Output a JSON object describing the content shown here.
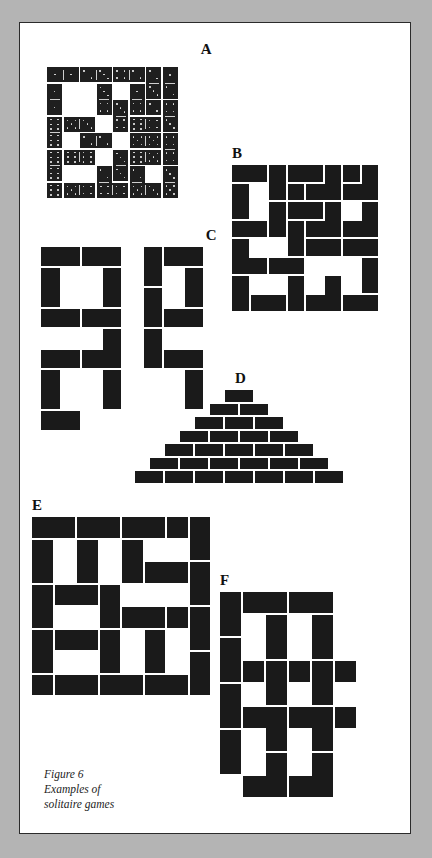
{
  "page": {
    "background_color": "#b4b4b4",
    "paper_color": "#ffffff",
    "border_color": "#2b2b2b",
    "domino_color": "#1a1a1a",
    "pip_color": "#e8e8e8"
  },
  "caption": {
    "line1": "Figure 6",
    "line2": "Examples of",
    "line3": "solitaire games"
  },
  "figures": [
    {
      "id": "A",
      "label": "A",
      "description": "8 by 8 square frame solitaire layout made of pipped dominoes",
      "cols": 8,
      "rows": 8,
      "cell": 16.5,
      "dominoes": [
        {
          "x": 0,
          "y": 0,
          "w": 2,
          "h": 1,
          "pips": [
            1,
            1
          ]
        },
        {
          "x": 2,
          "y": 0,
          "w": 2,
          "h": 1,
          "pips": [
            2,
            3
          ]
        },
        {
          "x": 4,
          "y": 0,
          "w": 2,
          "h": 1,
          "pips": [
            4,
            2
          ]
        },
        {
          "x": 6,
          "y": 0,
          "w": 1,
          "h": 2,
          "pips": [
            2,
            3
          ]
        },
        {
          "x": 7,
          "y": 0,
          "w": 1,
          "h": 2,
          "pips": [
            1,
            2
          ]
        },
        {
          "x": 0,
          "y": 1,
          "w": 1,
          "h": 2,
          "pips": [
            1,
            1
          ]
        },
        {
          "x": 3,
          "y": 1,
          "w": 1,
          "h": 2,
          "pips": [
            3,
            4
          ]
        },
        {
          "x": 5,
          "y": 1,
          "w": 1,
          "h": 2,
          "pips": [
            1,
            4
          ]
        },
        {
          "x": 4,
          "y": 2,
          "w": 1,
          "h": 2,
          "pips": [
            3,
            4
          ]
        },
        {
          "x": 7,
          "y": 2,
          "w": 1,
          "h": 2,
          "pips": [
            4,
            3
          ]
        },
        {
          "x": 0,
          "y": 3,
          "w": 1,
          "h": 2,
          "pips": [
            6,
            6
          ]
        },
        {
          "x": 1,
          "y": 3,
          "w": 2,
          "h": 1,
          "pips": [
            5,
            3
          ]
        },
        {
          "x": 5,
          "y": 3,
          "w": 2,
          "h": 1,
          "pips": [
            6,
            4
          ]
        },
        {
          "x": 2,
          "y": 4,
          "w": 2,
          "h": 1,
          "pips": [
            2,
            2
          ]
        },
        {
          "x": 5,
          "y": 4,
          "w": 2,
          "h": 1,
          "pips": [
            5,
            5
          ]
        },
        {
          "x": 7,
          "y": 4,
          "w": 1,
          "h": 2,
          "pips": [
            4,
            4
          ]
        },
        {
          "x": 1,
          "y": 5,
          "w": 2,
          "h": 1,
          "pips": [
            6,
            6
          ]
        },
        {
          "x": 4,
          "y": 5,
          "w": 1,
          "h": 2,
          "pips": [
            3,
            3
          ]
        },
        {
          "x": 5,
          "y": 5,
          "w": 2,
          "h": 1,
          "pips": [
            6,
            5
          ]
        },
        {
          "x": 0,
          "y": 5,
          "w": 1,
          "h": 2,
          "pips": [
            6,
            6
          ]
        },
        {
          "x": 3,
          "y": 6,
          "w": 1,
          "h": 2,
          "pips": [
            2,
            3
          ]
        },
        {
          "x": 5,
          "y": 6,
          "w": 1,
          "h": 2,
          "pips": [
            2,
            4
          ]
        },
        {
          "x": 7,
          "y": 6,
          "w": 1,
          "h": 2,
          "pips": [
            3,
            5
          ]
        },
        {
          "x": 0,
          "y": 7,
          "w": 1,
          "h": 1,
          "pips": [
            6
          ]
        },
        {
          "x": 1,
          "y": 7,
          "w": 2,
          "h": 1,
          "pips": [
            5,
            4
          ]
        },
        {
          "x": 3,
          "y": 7,
          "w": 2,
          "h": 1,
          "pips": [
            4,
            4
          ]
        },
        {
          "x": 5,
          "y": 7,
          "w": 2,
          "h": 1,
          "pips": [
            5,
            3
          ]
        },
        {
          "x": 6,
          "y": 2,
          "w": 1,
          "h": 1,
          "pips": [
            2
          ]
        }
      ]
    },
    {
      "id": "B",
      "label": "B",
      "description": "8 by 8 plain domino solitaire layout",
      "cols": 8,
      "rows": 8,
      "cell": 18.5,
      "dominoes": [
        {
          "x": 0,
          "y": 0,
          "w": 2,
          "h": 1
        },
        {
          "x": 2,
          "y": 0,
          "w": 1,
          "h": 2
        },
        {
          "x": 3,
          "y": 0,
          "w": 2,
          "h": 1
        },
        {
          "x": 5,
          "y": 0,
          "w": 1,
          "h": 2
        },
        {
          "x": 6,
          "y": 0,
          "w": 1,
          "h": 1
        },
        {
          "x": 7,
          "y": 0,
          "w": 1,
          "h": 2
        },
        {
          "x": 0,
          "y": 1,
          "w": 1,
          "h": 2
        },
        {
          "x": 3,
          "y": 1,
          "w": 1,
          "h": 1
        },
        {
          "x": 4,
          "y": 1,
          "w": 2,
          "h": 1
        },
        {
          "x": 6,
          "y": 1,
          "w": 2,
          "h": 1
        },
        {
          "x": 0,
          "y": 3,
          "w": 2,
          "h": 1
        },
        {
          "x": 2,
          "y": 2,
          "w": 1,
          "h": 2
        },
        {
          "x": 3,
          "y": 2,
          "w": 2,
          "h": 1
        },
        {
          "x": 5,
          "y": 2,
          "w": 1,
          "h": 2
        },
        {
          "x": 7,
          "y": 2,
          "w": 1,
          "h": 2
        },
        {
          "x": 3,
          "y": 3,
          "w": 1,
          "h": 2
        },
        {
          "x": 4,
          "y": 3,
          "w": 2,
          "h": 1
        },
        {
          "x": 6,
          "y": 3,
          "w": 2,
          "h": 1
        },
        {
          "x": 0,
          "y": 4,
          "w": 1,
          "h": 2
        },
        {
          "x": 4,
          "y": 4,
          "w": 2,
          "h": 1
        },
        {
          "x": 6,
          "y": 4,
          "w": 2,
          "h": 1
        },
        {
          "x": 0,
          "y": 5,
          "w": 2,
          "h": 1
        },
        {
          "x": 2,
          "y": 5,
          "w": 2,
          "h": 1
        },
        {
          "x": 7,
          "y": 5,
          "w": 1,
          "h": 2
        },
        {
          "x": 0,
          "y": 6,
          "w": 1,
          "h": 2
        },
        {
          "x": 3,
          "y": 6,
          "w": 1,
          "h": 2
        },
        {
          "x": 5,
          "y": 6,
          "w": 1,
          "h": 2
        },
        {
          "x": 1,
          "y": 7,
          "w": 2,
          "h": 1
        },
        {
          "x": 4,
          "y": 7,
          "w": 2,
          "h": 1
        },
        {
          "x": 6,
          "y": 7,
          "w": 2,
          "h": 1
        }
      ]
    },
    {
      "id": "C",
      "label": "C",
      "description": "Symmetric open-square pinwheel domino pattern",
      "cols": 8,
      "rows": 8,
      "cell": 20.5,
      "dominoes": [
        {
          "x": 0,
          "y": 0,
          "w": 2,
          "h": 1
        },
        {
          "x": 2,
          "y": 0,
          "w": 2,
          "h": 1
        },
        {
          "x": 5,
          "y": 0,
          "w": 1,
          "h": 2
        },
        {
          "x": 6,
          "y": 0,
          "w": 2,
          "h": 1
        },
        {
          "x": 0,
          "y": 1,
          "w": 1,
          "h": 2
        },
        {
          "x": 3,
          "y": 1,
          "w": 1,
          "h": 2
        },
        {
          "x": 7,
          "y": 1,
          "w": 1,
          "h": 2
        },
        {
          "x": 0,
          "y": 3,
          "w": 2,
          "h": 1
        },
        {
          "x": 2,
          "y": 3,
          "w": 2,
          "h": 1
        },
        {
          "x": 5,
          "y": 2,
          "w": 1,
          "h": 2
        },
        {
          "x": 6,
          "y": 3,
          "w": 2,
          "h": 1
        },
        {
          "x": 3,
          "y": 4,
          "w": 1,
          "h": 2
        },
        {
          "x": 5,
          "y": 4,
          "w": 1,
          "h": 2
        },
        {
          "x": 0,
          "y": 5,
          "w": 2,
          "h": 1
        },
        {
          "x": 2,
          "y": 5,
          "w": 2,
          "h": 1
        },
        {
          "x": 6,
          "y": 5,
          "w": 2,
          "h": 1
        },
        {
          "x": 0,
          "y": 6,
          "w": 1,
          "h": 2
        },
        {
          "x": 3,
          "y": 6,
          "w": 1,
          "h": 2
        },
        {
          "x": 7,
          "y": 6,
          "w": 1,
          "h": 2
        },
        {
          "x": 0,
          "y": 8,
          "w": 2,
          "h": 1
        }
      ]
    },
    {
      "id": "D",
      "label": "D",
      "description": "Pyramid of horizontal dominoes, seven rows",
      "rows": [
        1,
        2,
        3,
        4,
        5,
        6,
        7
      ],
      "brick_w": 30,
      "brick_h": 13.5
    },
    {
      "id": "E",
      "label": "E",
      "description": "8 by 8 domino solitaire layout with solid left and right borders",
      "cols": 8,
      "rows": 8,
      "cell": 22.5,
      "dominoes": [
        {
          "x": 0,
          "y": 0,
          "w": 2,
          "h": 1
        },
        {
          "x": 2,
          "y": 0,
          "w": 2,
          "h": 1
        },
        {
          "x": 4,
          "y": 0,
          "w": 2,
          "h": 1
        },
        {
          "x": 6,
          "y": 0,
          "w": 1,
          "h": 1
        },
        {
          "x": 7,
          "y": 0,
          "w": 1,
          "h": 2
        },
        {
          "x": 0,
          "y": 1,
          "w": 1,
          "h": 2
        },
        {
          "x": 2,
          "y": 1,
          "w": 1,
          "h": 2
        },
        {
          "x": 4,
          "y": 1,
          "w": 1,
          "h": 2
        },
        {
          "x": 7,
          "y": 2,
          "w": 1,
          "h": 2
        },
        {
          "x": 5,
          "y": 2,
          "w": 2,
          "h": 1
        },
        {
          "x": 0,
          "y": 3,
          "w": 1,
          "h": 2
        },
        {
          "x": 1,
          "y": 3,
          "w": 2,
          "h": 1
        },
        {
          "x": 3,
          "y": 3,
          "w": 1,
          "h": 2
        },
        {
          "x": 4,
          "y": 4,
          "w": 2,
          "h": 1
        },
        {
          "x": 6,
          "y": 4,
          "w": 1,
          "h": 1
        },
        {
          "x": 7,
          "y": 4,
          "w": 1,
          "h": 2
        },
        {
          "x": 0,
          "y": 5,
          "w": 1,
          "h": 2
        },
        {
          "x": 1,
          "y": 5,
          "w": 2,
          "h": 1
        },
        {
          "x": 3,
          "y": 5,
          "w": 1,
          "h": 2
        },
        {
          "x": 5,
          "y": 5,
          "w": 1,
          "h": 2
        },
        {
          "x": 7,
          "y": 6,
          "w": 1,
          "h": 2
        },
        {
          "x": 0,
          "y": 7,
          "w": 1,
          "h": 1
        },
        {
          "x": 1,
          "y": 7,
          "w": 2,
          "h": 1
        },
        {
          "x": 3,
          "y": 7,
          "w": 2,
          "h": 1
        },
        {
          "x": 5,
          "y": 7,
          "w": 2,
          "h": 1
        }
      ]
    },
    {
      "id": "F",
      "label": "F",
      "description": "Ladder style domino layout with tall vertical columns",
      "cols": 6,
      "rows": 8,
      "cell": 23,
      "dominoes": [
        {
          "x": 0,
          "y": 0,
          "w": 1,
          "h": 2
        },
        {
          "x": 1,
          "y": 0,
          "w": 2,
          "h": 1
        },
        {
          "x": 3,
          "y": 0,
          "w": 2,
          "h": 1
        },
        {
          "x": 2,
          "y": 1,
          "w": 1,
          "h": 2
        },
        {
          "x": 4,
          "y": 1,
          "w": 1,
          "h": 2
        },
        {
          "x": 0,
          "y": 2,
          "w": 1,
          "h": 2
        },
        {
          "x": 1,
          "y": 3,
          "w": 1,
          "h": 1
        },
        {
          "x": 3,
          "y": 3,
          "w": 1,
          "h": 1
        },
        {
          "x": 5,
          "y": 3,
          "w": 1,
          "h": 1
        },
        {
          "x": 2,
          "y": 3,
          "w": 1,
          "h": 2
        },
        {
          "x": 4,
          "y": 3,
          "w": 1,
          "h": 2
        },
        {
          "x": 0,
          "y": 4,
          "w": 1,
          "h": 2
        },
        {
          "x": 1,
          "y": 5,
          "w": 2,
          "h": 1
        },
        {
          "x": 3,
          "y": 5,
          "w": 2,
          "h": 1
        },
        {
          "x": 5,
          "y": 5,
          "w": 1,
          "h": 1
        },
        {
          "x": 2,
          "y": 5,
          "w": 1,
          "h": 2
        },
        {
          "x": 4,
          "y": 5,
          "w": 1,
          "h": 2
        },
        {
          "x": 0,
          "y": 6,
          "w": 1,
          "h": 2
        },
        {
          "x": 2,
          "y": 7,
          "w": 1,
          "h": 2
        },
        {
          "x": 4,
          "y": 7,
          "w": 1,
          "h": 2
        },
        {
          "x": 1,
          "y": 8,
          "w": 2,
          "h": 1
        },
        {
          "x": 3,
          "y": 8,
          "w": 2,
          "h": 1
        }
      ]
    }
  ]
}
